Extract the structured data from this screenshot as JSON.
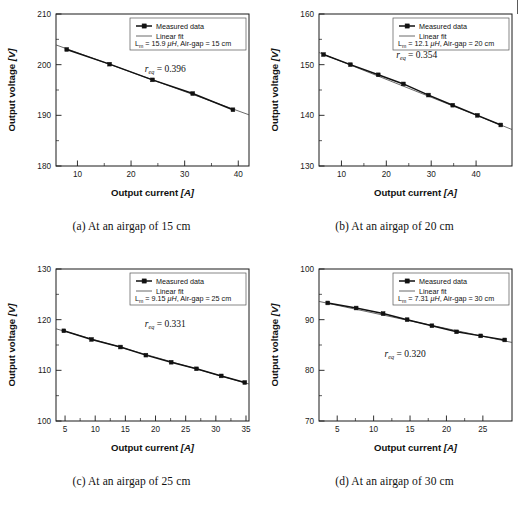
{
  "figure": {
    "axis_x_title": "Output current",
    "axis_x_unit": "[A]",
    "axis_y_title": "Output voltage",
    "axis_y_unit": "[V]",
    "legend_series_measured": "Measured data",
    "legend_series_fit": "Linear fit",
    "annotation_symbol": "r",
    "annotation_subscript": "eq",
    "legend_inductance_symbol": "L",
    "legend_inductance_subscript": "m",
    "legend_inductance_unit": "μH",
    "legend_airgap_label": "Air-gap",
    "legend_airgap_unit": "cm"
  },
  "chart_data": [
    {
      "type": "line",
      "panel": "a",
      "caption": "(a) At an airgap of 15 cm",
      "title": "",
      "xlabel": "Output current [A]",
      "ylabel": "Output voltage [V]",
      "xlim": [
        6,
        42
      ],
      "ylim": [
        180,
        210
      ],
      "xticks": [
        10,
        20,
        30,
        40
      ],
      "yticks": [
        180,
        190,
        200,
        210
      ],
      "grid": false,
      "legend_position": "top-right",
      "legend_entries": [
        "Measured data",
        "Linear fit"
      ],
      "annotations": {
        "r_eq": "0.396",
        "r_eq_text": "r_eq = 0.396",
        "L_m": "15.9",
        "L_m_text": "L_m = 15.9 μH",
        "airgap": "15",
        "airgap_text": "Air-gap = 15 cm",
        "legend_line": "L_m = 15.9 μH, Air-gap = 15 cm"
      },
      "series": [
        {
          "name": "Measured data",
          "x": [
            8.0,
            16.0,
            24.0,
            31.5,
            39.0
          ],
          "values": [
            203.0,
            200.1,
            197.0,
            194.3,
            191.1
          ]
        },
        {
          "name": "Linear fit",
          "x": [
            6.0,
            42.0
          ],
          "values": [
            203.9,
            190.1
          ]
        }
      ]
    },
    {
      "type": "line",
      "panel": "b",
      "caption": "(b) At an airgap of 20 cm",
      "title": "",
      "xlabel": "Output current [A]",
      "ylabel": "Output voltage [V]",
      "xlim": [
        5,
        48
      ],
      "ylim": [
        130,
        160
      ],
      "xticks": [
        10,
        20,
        30,
        40
      ],
      "yticks": [
        130,
        140,
        150,
        160
      ],
      "grid": false,
      "legend_position": "top-right",
      "legend_entries": [
        "Measured data",
        "Linear fit"
      ],
      "annotations": {
        "r_eq": "0.354",
        "r_eq_text": "r_eq = 0.354",
        "L_m": "12.1",
        "L_m_text": "L_m = 12.1 μH",
        "airgap": "20",
        "airgap_text": "Air-gap = 20 cm",
        "legend_line": "L_m = 12.1 μH, Air-gap = 20 cm"
      },
      "series": [
        {
          "name": "Measured data",
          "x": [
            6.0,
            12.0,
            18.2,
            23.8,
            29.4,
            34.8,
            40.3,
            45.5
          ],
          "values": [
            152.0,
            150.0,
            148.0,
            146.2,
            144.0,
            142.0,
            140.0,
            138.1
          ]
        },
        {
          "name": "Linear fit",
          "x": [
            5.0,
            48.0
          ],
          "values": [
            152.4,
            137.2
          ]
        }
      ]
    },
    {
      "type": "line",
      "panel": "c",
      "caption": "(c) At an airgap of 25 cm",
      "title": "",
      "xlabel": "Output current [A]",
      "ylabel": "Output voltage [V]",
      "xlim": [
        3.5,
        35.5
      ],
      "ylim": [
        100,
        130
      ],
      "xticks": [
        5,
        10,
        15,
        20,
        25,
        30,
        35
      ],
      "yticks": [
        100,
        110,
        120,
        130
      ],
      "grid": false,
      "legend_position": "top-right",
      "legend_entries": [
        "Measured data",
        "Linear fit"
      ],
      "annotations": {
        "r_eq": "0.331",
        "r_eq_text": "r_eq = 0.331",
        "L_m": "9.15",
        "L_m_text": "L_m = 9.15 μH",
        "airgap": "25",
        "airgap_text": "Air-gap = 25 cm",
        "legend_line": "L_m = 9.15 μH, Air-gap = 25 cm"
      },
      "series": [
        {
          "name": "Measured data",
          "x": [
            4.8,
            9.4,
            14.2,
            18.4,
            22.6,
            26.8,
            30.9,
            34.8
          ],
          "values": [
            117.8,
            116.1,
            114.6,
            113.0,
            111.6,
            110.3,
            108.9,
            107.6
          ]
        },
        {
          "name": "Linear fit",
          "x": [
            3.5,
            35.5
          ],
          "values": [
            118.2,
            107.3
          ]
        }
      ]
    },
    {
      "type": "line",
      "panel": "d",
      "caption": "(d) At an airgap of 30 cm",
      "title": "",
      "xlabel": "Output current [A]",
      "ylabel": "Output voltage [V]",
      "xlim": [
        2.5,
        29
      ],
      "ylim": [
        70,
        100
      ],
      "xticks": [
        5,
        10,
        15,
        20,
        25
      ],
      "yticks": [
        70,
        80,
        90,
        100
      ],
      "grid": false,
      "legend_position": "top-right",
      "legend_entries": [
        "Measured data",
        "Linear fit"
      ],
      "annotations": {
        "r_eq": "0.320",
        "r_eq_text": "r_eq = 0.320",
        "L_m": "7.31",
        "L_m_text": "L_m = 7.31 μH",
        "airgap": "30",
        "airgap_text": "Air-gap = 30 cm",
        "legend_line": "L_m = 7.31 μH, Air-gap = 30 cm"
      },
      "series": [
        {
          "name": "Measured data",
          "x": [
            3.7,
            7.6,
            11.3,
            14.6,
            18.0,
            21.4,
            24.7,
            28.0
          ],
          "values": [
            93.3,
            92.3,
            91.2,
            90.0,
            88.8,
            87.6,
            86.8,
            86.0
          ]
        },
        {
          "name": "Linear fit",
          "x": [
            2.5,
            29.0
          ],
          "values": [
            93.6,
            85.5
          ]
        }
      ]
    }
  ]
}
